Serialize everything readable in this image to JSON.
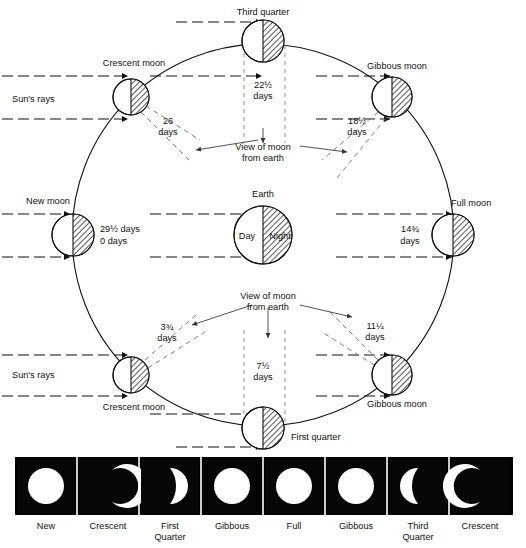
{
  "diagram": {
    "center_body": {
      "name": "Earth",
      "label": "Earth",
      "day_label": "Day",
      "night_label": "Night"
    },
    "sun_rays_labels": [
      "Sun's rays",
      "Sun's rays"
    ],
    "view_notes": [
      "View of moon\nfrom earth",
      "View of moon\nfrom earth"
    ],
    "view_note_line1": "View of moon",
    "view_note_line2": "from earth",
    "positions": [
      {
        "id": "new-moon",
        "label": "New moon",
        "days_line1": "29½ days",
        "days_line2": "0   days",
        "angle_deg": 180
      },
      {
        "id": "crescent-moon-upper",
        "label": "Crescent moon",
        "days_line1": "26",
        "days_line2": "days",
        "angle_deg": 135
      },
      {
        "id": "third-quarter",
        "label": "Third quarter",
        "days_line1": "22½",
        "days_line2": "days",
        "angle_deg": 90
      },
      {
        "id": "gibbous-moon-upper",
        "label": "Gibbous moon",
        "days_line1": "18½",
        "days_line2": "days",
        "angle_deg": 45
      },
      {
        "id": "full-moon",
        "label": "Full moon",
        "days_line1": "14¾",
        "days_line2": "days",
        "angle_deg": 0
      },
      {
        "id": "gibbous-moon-lower",
        "label": "Gibbous moon",
        "days_line1": "11¼",
        "days_line2": "days",
        "angle_deg": 315
      },
      {
        "id": "first-quarter",
        "label": "First quarter",
        "days_line1": "7½",
        "days_line2": "days",
        "angle_deg": 270
      },
      {
        "id": "crescent-moon-lower",
        "label": "Crescent moon",
        "days_line1": "3¾",
        "days_line2": "days",
        "angle_deg": 225
      }
    ]
  },
  "photo_strip": {
    "panels": [
      {
        "label_line1": "New",
        "label_line2": "",
        "phase": "full-disc"
      },
      {
        "label_line1": "Crescent",
        "label_line2": "",
        "phase": "crescent-left"
      },
      {
        "label_line1": "First",
        "label_line2": "Quarter",
        "phase": "half-right"
      },
      {
        "label_line1": "Gibbous",
        "label_line2": "",
        "phase": "gibbous-right"
      },
      {
        "label_line1": "Full",
        "label_line2": "",
        "phase": "full-disc"
      },
      {
        "label_line1": "Gibbous",
        "label_line2": "",
        "phase": "gibbous-left"
      },
      {
        "label_line1": "Third",
        "label_line2": "Quarter",
        "phase": "half-left"
      },
      {
        "label_line1": "Crescent",
        "label_line2": "",
        "phase": "crescent-right"
      }
    ]
  },
  "colors": {
    "ink": "#111111",
    "hatch": "#333333",
    "strip_background": "#000000",
    "moon_bright": "#ffffff",
    "guide": "#888888"
  }
}
